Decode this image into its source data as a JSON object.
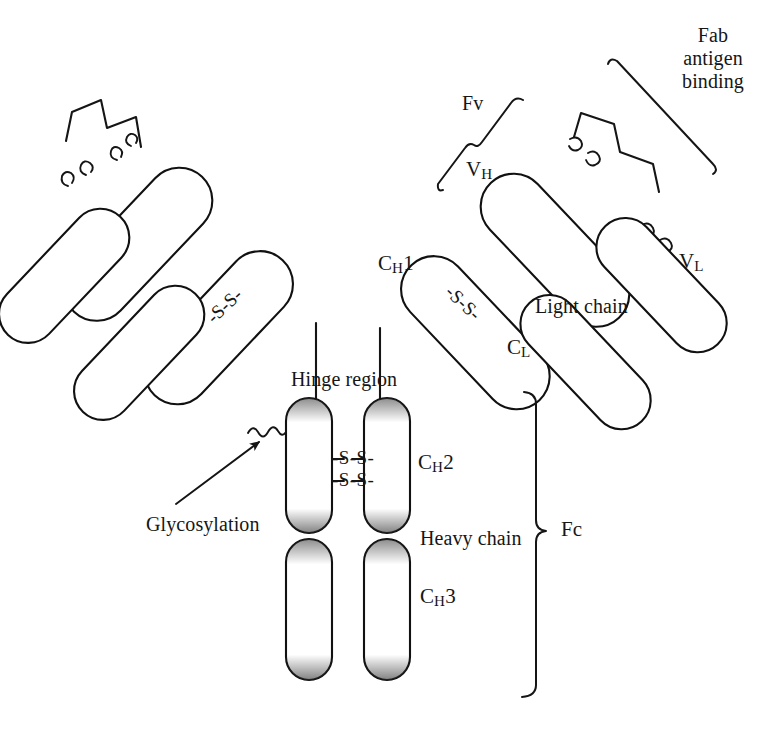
{
  "figure": {
    "type": "schematic-diagram",
    "background_color": "#ffffff",
    "ink_color": "#161616"
  },
  "labels": {
    "fab_antigen_binding": {
      "line1": "Fab",
      "line2": "antigen",
      "line3": "binding"
    },
    "fv": "Fv",
    "vh_prefix": "V",
    "vh_sub": "H",
    "vl_prefix": "V",
    "vl_sub": "L",
    "ch1_prefix": "C",
    "ch1_sub": "H",
    "ch1_suffix": "1",
    "cl_prefix": "C",
    "cl_sub": "L",
    "ch2_prefix": "C",
    "ch2_sub": "H",
    "ch2_suffix": "2",
    "ch3_prefix": "C",
    "ch3_sub": "H",
    "ch3_suffix": "3",
    "light_chain": "Light chain",
    "heavy_chain": "Heavy chain",
    "hinge_region": "Hinge region",
    "glycosylation": "Glycosylation",
    "fc": "Fc",
    "disulfide": "-S-S-",
    "disulfide_left_arm": "-S-S-",
    "disulfide_right_arm": "-S-S-",
    "disulfide_hinge_upper": "-S-S-",
    "disulfide_hinge_lower": "-S-S-"
  },
  "structure": {
    "chains": [
      {
        "name": "heavy-chain-left",
        "style": "shaded",
        "domains": [
          "VH",
          "CH1",
          "CH2",
          "CH3"
        ]
      },
      {
        "name": "heavy-chain-right",
        "style": "shaded",
        "domains": [
          "VH",
          "CH1",
          "CH2",
          "CH3"
        ]
      },
      {
        "name": "light-chain-left",
        "style": "outline",
        "domains": [
          "VL",
          "CL"
        ]
      },
      {
        "name": "light-chain-right",
        "style": "outline",
        "domains": [
          "VL",
          "CL"
        ]
      }
    ],
    "features": [
      "CDR zigzag loops at variable-domain tips",
      "interchain disulfide bonds between heavy and light chains",
      "two interchain disulfide bonds at the hinge",
      "N-linked glycosylation on CH2"
    ],
    "brackets": [
      "Fv",
      "Fab antigen binding",
      "Fc"
    ]
  }
}
